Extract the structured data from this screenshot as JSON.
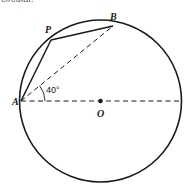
{
  "figure": {
    "clipped_caption": "circular.",
    "type": "circle-geometry-diagram",
    "background_color": "#ffffff",
    "stroke_color": "#1a1a1a",
    "circle": {
      "center_label": "O",
      "cx": 100.5,
      "cy": 101,
      "r": 81,
      "stroke_width": 1.6
    },
    "points": [
      {
        "label": "A",
        "x": 21,
        "y": 101,
        "label_x": 12,
        "label_y": 105,
        "marker": false
      },
      {
        "label": "P",
        "x": 51,
        "y": 40,
        "label_x": 45,
        "label_y": 33,
        "marker": false
      },
      {
        "label": "B",
        "x": 113,
        "y": 26,
        "label_x": 110,
        "label_y": 20,
        "marker": false
      },
      {
        "label": "O",
        "x": 100.5,
        "y": 101,
        "label_x": 97,
        "label_y": 117,
        "marker": true
      }
    ],
    "solid_segments": [
      {
        "name": "chord-AP",
        "x1": 21,
        "y1": 101,
        "x2": 51,
        "y2": 40
      },
      {
        "name": "chord-PB",
        "x1": 51,
        "y1": 40,
        "x2": 113,
        "y2": 26
      }
    ],
    "dashed_segments": [
      {
        "name": "chord-AB",
        "x1": 21,
        "y1": 101,
        "x2": 113,
        "y2": 26
      },
      {
        "name": "diameter-horizontal",
        "x1": 21,
        "y1": 101,
        "x2": 181,
        "y2": 101
      }
    ],
    "angle": {
      "label": "40°",
      "value": 40,
      "unit": "degrees",
      "vertex": "A",
      "between": [
        "AB",
        "AO"
      ],
      "label_x": 46,
      "label_y": 93,
      "arc_radius": 24
    },
    "center_dot_radius": 2.2,
    "dash_pattern": "5,3.5"
  }
}
